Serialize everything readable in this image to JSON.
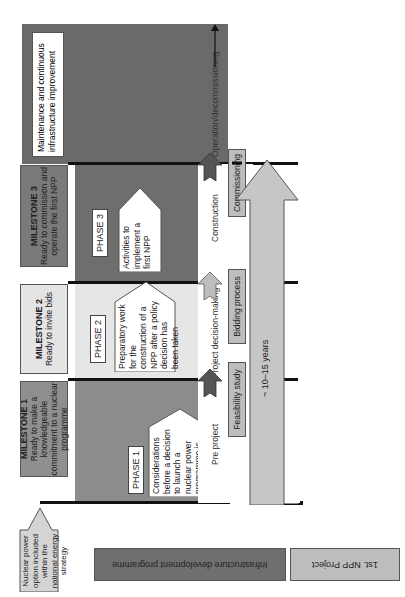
{
  "diagram": {
    "orientation": "rotated-90-ccw",
    "colors": {
      "phase1_bg": "#8c8c8c",
      "phase2_bg": "#e6e6e6",
      "phase3_bg": "#6e6e6e",
      "operation_bg": "#6a6a6a",
      "milestone1_bg": "#8f8f8f",
      "milestone2_bg": "#e4e4e4",
      "milestone3_bg": "#7a7a7a",
      "line": "#111111"
    },
    "start_box": {
      "text": "Nuclear power option included within the national energy strategy"
    },
    "milestones": [
      {
        "title": "MILESTONE 1",
        "text": "Ready to make a knowledgeable commitment to a nuclear programme"
      },
      {
        "title": "MILESTONE 2",
        "text": "Ready to invite bids"
      },
      {
        "title": "MILESTONE 3",
        "text": "Ready to commission and operate the first NPP"
      }
    ],
    "phases": [
      {
        "label": "PHASE 1",
        "text": "Considerations before a decision to launch a nuclear power programme is taken"
      },
      {
        "label": "PHASE 2",
        "text": "Preparatory work for the construction of a NPP after a policy decision has been taken"
      },
      {
        "label": "PHASE 3",
        "text": "Activities to implement a first NPP"
      }
    ],
    "operation_box": {
      "text": "Maintenance and continuous infrastructure improvement"
    },
    "project_stages": [
      {
        "label": "Pre project"
      },
      {
        "label": "Project decision-making"
      },
      {
        "label": "Construction"
      },
      {
        "label": "Operation/decommissioning"
      }
    ],
    "project_steps": [
      {
        "label": "Feasibility study"
      },
      {
        "label": "Bidding process"
      },
      {
        "label": "Commissioning"
      }
    ],
    "duration": {
      "label": "~ 10–15 years"
    },
    "legend": [
      {
        "label": "Infrastructure development programme"
      },
      {
        "label": "1st. NPP Project"
      }
    ]
  }
}
